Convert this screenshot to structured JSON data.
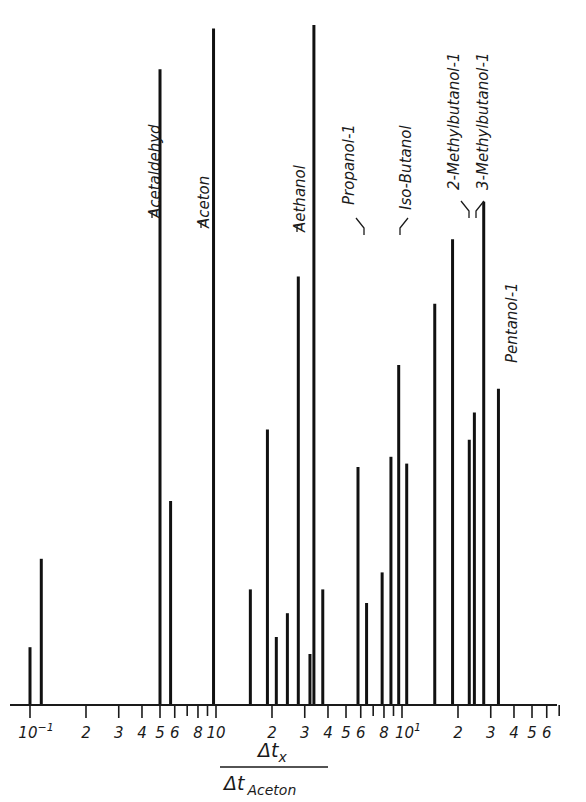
{
  "chart_data": {
    "type": "bar",
    "subtype": "stick-spectrum (chromatogram retention, log x-axis)",
    "title": "",
    "xlabel": "Δt_x / Δt_Aceton",
    "xlabel_numerator": "Δt",
    "xlabel_numerator_sub": "x",
    "xlabel_denominator": "Δt",
    "xlabel_denominator_sub": "Aceton",
    "ylabel": "",
    "xscale": "log",
    "xlim": [
      0.095,
      70
    ],
    "ylim": [
      0,
      100
    ],
    "grid": false,
    "legend": null,
    "x_tick_labels": [
      "10⁻¹",
      "2",
      "3",
      "4",
      "5",
      "6",
      "8",
      "10",
      "2",
      "3",
      "4",
      "5",
      "6",
      "8",
      "10¹",
      "2",
      "3",
      "4",
      "5",
      "6"
    ],
    "x_ticks": [
      {
        "value": 0.1,
        "label": "10",
        "sup": "-1"
      },
      {
        "value": 0.2,
        "label": "2"
      },
      {
        "value": 0.3,
        "label": "3"
      },
      {
        "value": 0.4,
        "label": "4"
      },
      {
        "value": 0.5,
        "label": "5"
      },
      {
        "value": 0.6,
        "label": "6"
      },
      {
        "value": 0.7,
        "label": ""
      },
      {
        "value": 0.8,
        "label": "8"
      },
      {
        "value": 0.9,
        "label": ""
      },
      {
        "value": 1.0,
        "label": "10"
      },
      {
        "value": 2.0,
        "label": "2"
      },
      {
        "value": 3.0,
        "label": "3"
      },
      {
        "value": 4.0,
        "label": "4"
      },
      {
        "value": 5.0,
        "label": "5"
      },
      {
        "value": 6.0,
        "label": "6"
      },
      {
        "value": 7.0,
        "label": ""
      },
      {
        "value": 8.0,
        "label": "8"
      },
      {
        "value": 9.0,
        "label": ""
      },
      {
        "value": 10.0,
        "label": "10",
        "sup": "1"
      },
      {
        "value": 20.0,
        "label": "2"
      },
      {
        "value": 30.0,
        "label": "3"
      },
      {
        "value": 40.0,
        "label": "4"
      },
      {
        "value": 50.0,
        "label": "5"
      },
      {
        "value": 60.0,
        "label": "6"
      },
      {
        "value": 70.0,
        "label": ""
      }
    ],
    "peaks": [
      {
        "x": 0.1,
        "height": 8.5,
        "label": ""
      },
      {
        "x": 0.115,
        "height": 21.5,
        "label": ""
      },
      {
        "x": 0.5,
        "height": 93.5,
        "label": "Acetaldehyd"
      },
      {
        "x": 0.57,
        "height": 30,
        "label": ""
      },
      {
        "x": 0.97,
        "height": 99.5,
        "label": "Aceton"
      },
      {
        "x": 1.53,
        "height": 17,
        "label": ""
      },
      {
        "x": 1.89,
        "height": 40.5,
        "label": ""
      },
      {
        "x": 2.11,
        "height": 10,
        "label": ""
      },
      {
        "x": 2.42,
        "height": 13.5,
        "label": ""
      },
      {
        "x": 2.77,
        "height": 63,
        "label": ""
      },
      {
        "x": 3.2,
        "height": 7.5,
        "label": ""
      },
      {
        "x": 3.36,
        "height": 100,
        "label": "Aethanol"
      },
      {
        "x": 3.75,
        "height": 17,
        "label": ""
      },
      {
        "x": 5.8,
        "height": 35,
        "label": "Propanol-1"
      },
      {
        "x": 6.45,
        "height": 15,
        "label": ""
      },
      {
        "x": 7.82,
        "height": 19.5,
        "label": ""
      },
      {
        "x": 8.72,
        "height": 36.5,
        "label": ""
      },
      {
        "x": 9.6,
        "height": 50,
        "label": "Iso-Butanol"
      },
      {
        "x": 10.6,
        "height": 35.5,
        "label": ""
      },
      {
        "x": 15.0,
        "height": 59,
        "label": ""
      },
      {
        "x": 18.7,
        "height": 68.5,
        "label": "2-Methylbutanol-1"
      },
      {
        "x": 23.0,
        "height": 39,
        "label": ""
      },
      {
        "x": 24.5,
        "height": 43,
        "label": ""
      },
      {
        "x": 27.5,
        "height": 74,
        "label": "3-Methylbutanol-1"
      },
      {
        "x": 33.0,
        "height": 46.5,
        "label": "Pentanol-1"
      }
    ],
    "annotations": [
      "Acetaldehyd",
      "Aceton",
      "Aethanol",
      "Propanol-1",
      "Iso-Butanol",
      "2-Methylbutanol-1",
      "3-Methylbutanol-1",
      "Pentanol-1"
    ]
  },
  "layout": {
    "baseline_y": 705,
    "top_y": 25,
    "decade_px": 186,
    "x_at_one": 216,
    "ink_color": "#111111",
    "background": "#ffffff"
  }
}
